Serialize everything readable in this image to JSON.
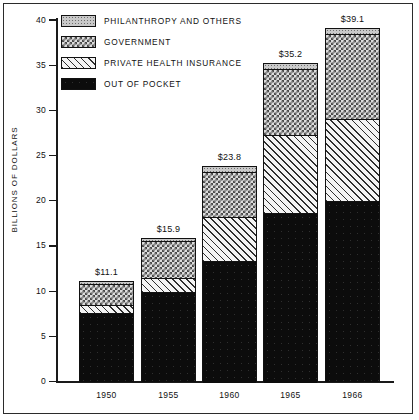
{
  "chart_data": {
    "type": "bar",
    "title": "",
    "subtitle": "",
    "xlabel": "",
    "ylabel": "BILLIONS OF DOLLARS",
    "ylim": [
      0,
      40
    ],
    "yticks": [
      0,
      5,
      10,
      15,
      20,
      25,
      30,
      35,
      40
    ],
    "ytick_labels": [
      "0",
      "5",
      "10",
      "15",
      "20",
      "25",
      "30",
      "35",
      "40"
    ],
    "grid": false,
    "stacked": true,
    "legend_position": "top-left",
    "categories": [
      "1950",
      "1955",
      "1960",
      "1965",
      "1966"
    ],
    "totals": [
      11.1,
      15.9,
      23.8,
      35.2,
      39.1
    ],
    "total_labels": [
      "$11.1",
      "$15.9",
      "$23.8",
      "$35.2",
      "$39.1"
    ],
    "series": [
      {
        "name": "OUT OF POCKET",
        "pattern": "solid-black",
        "values": [
          7.6,
          9.9,
          13.3,
          18.7,
          20.0
        ]
      },
      {
        "name": "PRIVATE HEALTH INSURANCE",
        "pattern": "diagonal-lines",
        "values": [
          0.9,
          1.5,
          4.9,
          8.6,
          9.0
        ]
      },
      {
        "name": "GOVERNMENT",
        "pattern": "checkerboard",
        "values": [
          2.3,
          4.1,
          5.0,
          7.3,
          9.4
        ]
      },
      {
        "name": "PHILANTHROPY AND OTHERS",
        "pattern": "stipple-gray",
        "values": [
          0.3,
          0.4,
          0.6,
          0.6,
          0.7
        ]
      }
    ]
  },
  "legend": {
    "items": [
      {
        "label": "PHILANTHROPY AND OTHERS",
        "swatch": "stipple-gray"
      },
      {
        "label": "GOVERNMENT",
        "swatch": "checkerboard"
      },
      {
        "label": "PRIVATE HEALTH INSURANCE",
        "swatch": "diagonal-lines"
      },
      {
        "label": "OUT OF POCKET",
        "swatch": "solid-black"
      }
    ]
  },
  "axis": {
    "y_title": "BILLIONS OF DOLLARS",
    "y_tick_labels": [
      "40",
      "35",
      "30",
      "25",
      "20",
      "15",
      "10",
      "5",
      "0"
    ],
    "x_tick_labels": [
      "1950",
      "1955",
      "1960",
      "1965",
      "1966"
    ]
  },
  "colors": {
    "ink": "#111111",
    "out_of_pocket": "#0c0c0c",
    "private_health_insurance": "#efefef",
    "government": "#dcdcdc",
    "philanthropy_and_others": "#c9c9c9",
    "background": "#ffffff"
  }
}
